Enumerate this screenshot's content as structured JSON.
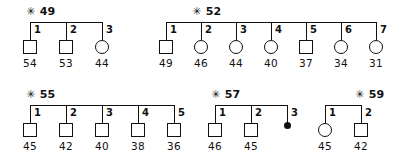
{
  "diagram": {
    "type": "pedigree-sibship-chart",
    "star_glyph": "✳",
    "symbol_legend": {
      "square": "male",
      "circle": "female",
      "filled-dot": "deceased-or-unborn"
    }
  },
  "families": [
    {
      "id": "fam-49",
      "label_number": "49",
      "label_text": "✳ 49",
      "bar": {
        "x": 30,
        "y": 22,
        "width": 72
      },
      "label_pos": {
        "x": 26,
        "y": 6
      },
      "members": [
        {
          "ordinal": "1",
          "shape": "square",
          "age": "54",
          "x": 30
        },
        {
          "ordinal": "2",
          "shape": "square",
          "age": "53",
          "x": 66
        },
        {
          "ordinal": "3",
          "shape": "circle",
          "age": "44",
          "x": 102
        }
      ]
    },
    {
      "id": "fam-52",
      "label_number": "52",
      "label_text": "✳ 52",
      "bar": {
        "x": 166,
        "y": 22,
        "width": 210
      },
      "label_pos": {
        "x": 192,
        "y": 6
      },
      "members": [
        {
          "ordinal": "1",
          "shape": "square",
          "age": "49",
          "x": 166
        },
        {
          "ordinal": "2",
          "shape": "circle",
          "age": "46",
          "x": 201
        },
        {
          "ordinal": "3",
          "shape": "circle",
          "age": "44",
          "x": 236
        },
        {
          "ordinal": "4",
          "shape": "circle",
          "age": "40",
          "x": 271
        },
        {
          "ordinal": "5",
          "shape": "square",
          "age": "37",
          "x": 306
        },
        {
          "ordinal": "6",
          "shape": "circle",
          "age": "34",
          "x": 341
        },
        {
          "ordinal": "7",
          "shape": "circle",
          "age": "31",
          "x": 376
        }
      ]
    },
    {
      "id": "fam-55",
      "label_number": "55",
      "label_text": "✳ 55",
      "bar": {
        "x": 30,
        "y": 105,
        "width": 144
      },
      "label_pos": {
        "x": 26,
        "y": 89
      },
      "members": [
        {
          "ordinal": "1",
          "shape": "square",
          "age": "45",
          "x": 30
        },
        {
          "ordinal": "2",
          "shape": "square",
          "age": "42",
          "x": 66
        },
        {
          "ordinal": "3",
          "shape": "square",
          "age": "40",
          "x": 102
        },
        {
          "ordinal": "4",
          "shape": "square",
          "age": "38",
          "x": 138
        },
        {
          "ordinal": "5",
          "shape": "square",
          "age": "36",
          "x": 174
        }
      ]
    },
    {
      "id": "fam-57",
      "label_number": "57",
      "label_text": "✳ 57",
      "bar": {
        "x": 215,
        "y": 105,
        "width": 72
      },
      "label_pos": {
        "x": 211,
        "y": 89
      },
      "members": [
        {
          "ordinal": "1",
          "shape": "square",
          "age": "46",
          "x": 215
        },
        {
          "ordinal": "2",
          "shape": "square",
          "age": "45",
          "x": 251
        },
        {
          "ordinal": "3",
          "shape": "dot",
          "age": "",
          "x": 287
        }
      ]
    },
    {
      "id": "fam-59",
      "label_number": "59",
      "label_text": "✳ 59",
      "bar": {
        "x": 325,
        "y": 105,
        "width": 36
      },
      "label_pos": {
        "x": 355,
        "y": 89
      },
      "members": [
        {
          "ordinal": "1",
          "shape": "circle",
          "age": "45",
          "x": 325
        },
        {
          "ordinal": "2",
          "shape": "square",
          "age": "42",
          "x": 361
        }
      ]
    }
  ],
  "geometry": {
    "drop_height": 18,
    "symbol_size": 12,
    "age_offset_y": 36,
    "ordinal_offset_x": 4,
    "ordinal_offset_y": 3
  }
}
